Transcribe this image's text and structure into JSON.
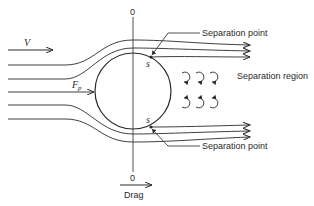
{
  "diagram": {
    "labels": {
      "velocity": "V",
      "pressure_force": "F",
      "pressure_force_sub": "p",
      "separation_point_top": "Separation point",
      "separation_point_bottom": "Separation point",
      "separation_region": "Separation region",
      "sep_marker_top": "s",
      "sep_marker_bottom": "s",
      "axis_top_zero": "0",
      "axis_bottom_zero": "0",
      "drag": "Drag"
    },
    "colors": {
      "stroke": "#2a2a2a",
      "background": "#ffffff"
    }
  }
}
